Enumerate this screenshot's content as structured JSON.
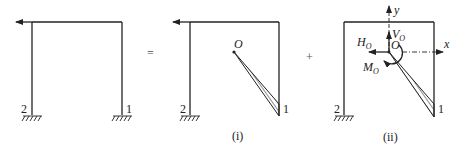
{
  "operators": {
    "equals": "=",
    "plus": "+"
  },
  "frames": [
    {
      "id": "original",
      "caption": "",
      "node_left": "2",
      "node_right": "1"
    },
    {
      "id": "part-i",
      "caption": "(i)",
      "node_left": "2",
      "node_right": "1",
      "point": "O"
    },
    {
      "id": "part-ii",
      "caption": "(ii)",
      "node_left": "2",
      "node_right": "1",
      "point": "O",
      "axis_x": "x",
      "axis_y": "y",
      "forces": {
        "H": "H",
        "H_sub": "O",
        "V": "V",
        "V_sub": "O",
        "M": "M",
        "M_sub": "O"
      }
    }
  ],
  "colors": {
    "line": "#222222",
    "background": "#ffffff"
  }
}
